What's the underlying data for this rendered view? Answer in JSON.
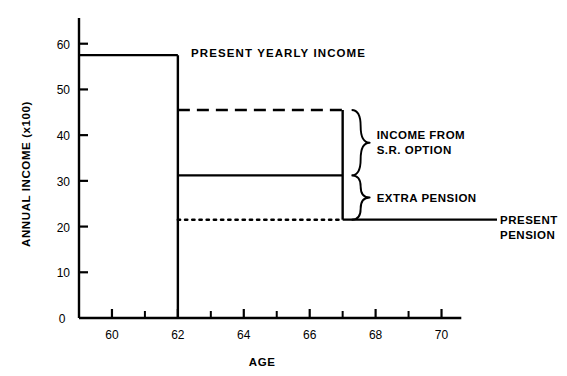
{
  "chart_data": {
    "type": "line",
    "title": "PRESENT YEARLY INCOME",
    "xlabel": "AGE",
    "ylabel": "ANNUAL INCOME (x100)",
    "xlim": [
      59.0,
      70.5
    ],
    "ylim": [
      0,
      63
    ],
    "grid": false,
    "legend_position": "right-annotations",
    "x_ticks_major": [
      60,
      62,
      64,
      66,
      68,
      70
    ],
    "x_tick_labels": [
      "60",
      "62",
      "64",
      "66",
      "68",
      "70"
    ],
    "x_ticks_minor": [
      61,
      63,
      65,
      67,
      69
    ],
    "y_ticks": [
      0,
      10,
      20,
      30,
      40,
      50,
      60
    ],
    "y_tick_labels": [
      "0",
      "10",
      "20",
      "30",
      "40",
      "50",
      "60"
    ],
    "origin_label": "0",
    "series": [
      {
        "name": "PRESENT YEARLY INCOME",
        "style": "solid",
        "value": 57.5,
        "x_start": 59.0,
        "x_end": 62.0,
        "drop_to": 0
      },
      {
        "name": "INCOME FROM S.R. OPTION",
        "style": "dashed",
        "value": 45.5,
        "x_start": 62.0,
        "x_end": 67.0
      },
      {
        "name": "EXTRA PENSION",
        "style": "solid",
        "value": 31.2,
        "x_start": 62.0,
        "x_end": 67.0
      },
      {
        "name": "PRESENT PENSION",
        "style": "dotted",
        "value": 21.5,
        "x_start": 62.0,
        "x_end": 67.0
      }
    ],
    "annotations": [
      {
        "id": "income-from-sr-option",
        "line1": "INCOME FROM",
        "line2": "S.R. OPTION",
        "brace_from": 45.5,
        "brace_to": 31.2
      },
      {
        "id": "extra-pension",
        "line1": "EXTRA PENSION",
        "line2": "",
        "brace_from": 31.2,
        "brace_to": 21.5
      },
      {
        "id": "present-pension",
        "line1": "PRESENT",
        "line2": "PENSION",
        "leader_at": 21.5
      }
    ],
    "colors": {
      "ink": "#000000",
      "background": "#ffffff"
    }
  }
}
